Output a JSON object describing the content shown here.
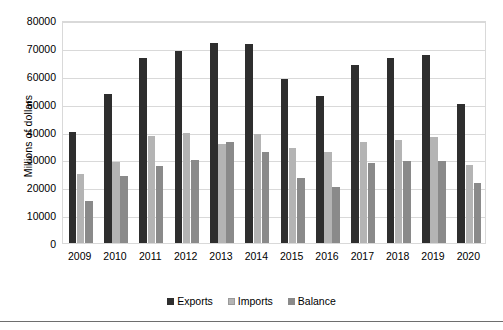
{
  "chart_data": {
    "type": "bar",
    "title": "",
    "xlabel": "",
    "ylabel": "Millions of dollars",
    "categories": [
      "2009",
      "2010",
      "2011",
      "2012",
      "2013",
      "2014",
      "2015",
      "2016",
      "2017",
      "2018",
      "2019",
      "2020"
    ],
    "series": [
      {
        "name": "Exports",
        "color": "#2e2e2e",
        "values": [
          39700,
          53600,
          66300,
          68900,
          71800,
          71400,
          58800,
          52800,
          63800,
          66200,
          67400,
          50000
        ]
      },
      {
        "name": "Imports",
        "color": "#b4b4b4",
        "values": [
          24600,
          29100,
          38500,
          39400,
          35700,
          39100,
          34200,
          32800,
          36200,
          37000,
          38000,
          28000
        ]
      },
      {
        "name": "Balance",
        "color": "#8a8a8a",
        "values": [
          15100,
          24200,
          27700,
          29700,
          36100,
          32700,
          23500,
          20000,
          28800,
          29300,
          29500,
          21500
        ]
      }
    ],
    "ylim": [
      0,
      80000
    ],
    "yticks": [
      0,
      10000,
      20000,
      30000,
      40000,
      50000,
      60000,
      70000,
      80000
    ],
    "ytick_labels": [
      "0",
      "10000",
      "20000",
      "30000",
      "40000",
      "50000",
      "60000",
      "70000",
      "80000"
    ],
    "grid": true,
    "legend_position": "bottom"
  }
}
